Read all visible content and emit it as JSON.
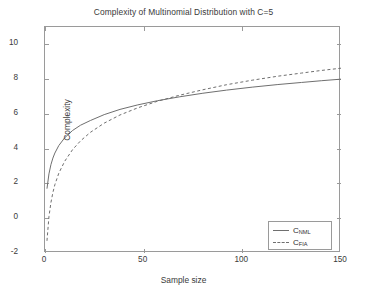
{
  "chart_data": {
    "type": "line",
    "title": "Complexity of Multinomial Distribution with C=5",
    "xlabel": "Sample size",
    "ylabel": "Complexity",
    "xlim": [
      0,
      150
    ],
    "ylim": [
      -2,
      11
    ],
    "xticks": [
      0,
      50,
      100,
      150
    ],
    "xtick_labels": [
      "0",
      "50",
      "100",
      "150"
    ],
    "yticks": [
      -2,
      0,
      2,
      4,
      6,
      8,
      10
    ],
    "ytick_labels": [
      "-2",
      "0",
      "2",
      "4",
      "6",
      "8",
      "10"
    ],
    "grid": false,
    "legend_position": "lower right",
    "series": [
      {
        "name": "C_NML",
        "legend_label": "C",
        "legend_sub": "NML",
        "style": "solid",
        "color": "#6f6f6f",
        "x": [
          1,
          2,
          3,
          4,
          5,
          7,
          10,
          14,
          18,
          23,
          30,
          38,
          47,
          57,
          68,
          80,
          92,
          105,
          118,
          130,
          140,
          150
        ],
        "y": [
          1.7,
          2.55,
          3.08,
          3.46,
          3.75,
          4.18,
          4.63,
          5.05,
          5.35,
          5.62,
          5.96,
          6.26,
          6.52,
          6.76,
          6.98,
          7.19,
          7.37,
          7.54,
          7.69,
          7.81,
          7.91,
          8.0
        ]
      },
      {
        "name": "C_FIA",
        "legend_label": "C",
        "legend_sub": "FIA",
        "style": "dashed",
        "color": "#6f6f6f",
        "x": [
          1,
          2,
          3,
          4,
          5,
          7,
          10,
          14,
          18,
          23,
          30,
          38,
          47,
          57,
          68,
          80,
          92,
          105,
          118,
          130,
          140,
          150
        ],
        "y": [
          -1.3,
          0.09,
          0.9,
          1.48,
          1.93,
          2.59,
          3.28,
          3.95,
          4.45,
          4.94,
          5.47,
          5.94,
          6.35,
          6.73,
          7.07,
          7.39,
          7.68,
          7.94,
          8.17,
          8.35,
          8.5,
          8.63
        ]
      }
    ],
    "note": "Both curves are approximately logarithmic in sample size; C_NML lies above C_FIA across the plotted range and the two converge slowly as sample size grows."
  },
  "axes": {
    "box_color": "#9a9a9a",
    "tick_color": "#9a9a9a",
    "text_color": "#3a3a3a"
  },
  "figure": {
    "background": "#ffffff"
  }
}
